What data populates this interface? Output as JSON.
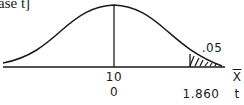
{
  "caption": "ase t]",
  "diagram": {
    "type": "t-distribution curve with shaded right tail",
    "center_labels": {
      "x_value": "10",
      "t_value": "0"
    },
    "critical_labels": {
      "t_value": "1.860"
    },
    "tail_area_label": ".05",
    "axis_labels": {
      "x": "X",
      "t": "t"
    }
  },
  "colors": {
    "ink": "#1a1a1a",
    "background": "#ffffff"
  }
}
